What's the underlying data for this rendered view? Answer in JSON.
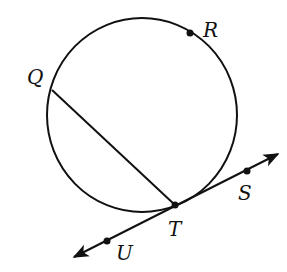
{
  "diagram": {
    "type": "circle-with-tangent-and-chord",
    "circle": {
      "cx": 142,
      "cy": 115,
      "rx": 95,
      "ry": 97
    },
    "points": [
      {
        "name": "Q",
        "x": 52,
        "y": 90,
        "label_x": 27,
        "label_y": 84,
        "dot": false
      },
      {
        "name": "R",
        "x": 190,
        "y": 33,
        "label_x": 203,
        "label_y": 37,
        "dot": true
      },
      {
        "name": "T",
        "x": 175,
        "y": 205,
        "label_x": 168,
        "label_y": 236,
        "dot": true
      },
      {
        "name": "S",
        "x": 247,
        "y": 171,
        "label_x": 238,
        "label_y": 200,
        "dot": true
      },
      {
        "name": "U",
        "x": 107,
        "y": 241,
        "label_x": 116,
        "label_y": 260,
        "dot": true
      }
    ],
    "segments": [
      {
        "name": "chord-QT",
        "from": "Q",
        "to": "T"
      }
    ],
    "lines": [
      {
        "name": "tangent-line-US",
        "through": [
          "U",
          "T",
          "S"
        ],
        "arrows": "both"
      }
    ],
    "labels": {
      "Q": "Q",
      "R": "R",
      "T": "T",
      "S": "S",
      "U": "U"
    },
    "colors": {
      "stroke": "#111111",
      "background": "#ffffff"
    }
  }
}
